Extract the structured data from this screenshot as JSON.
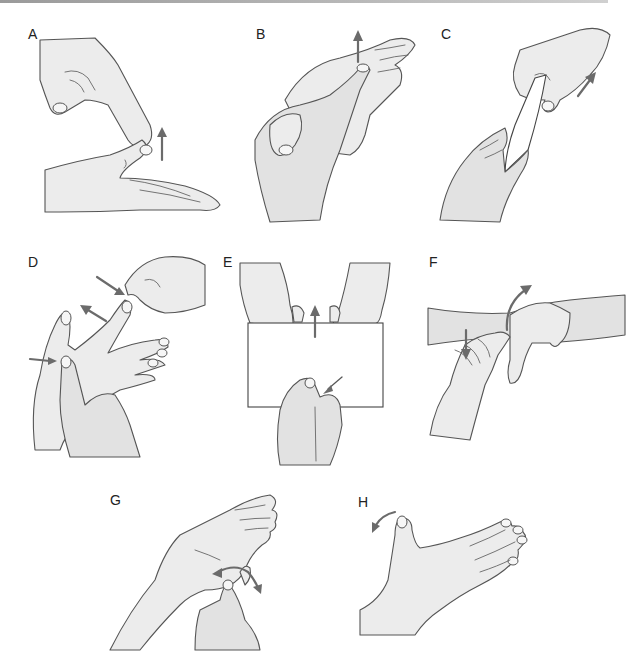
{
  "figure": {
    "top_rule_color": "#a8a8a8",
    "arrow_color": "#6b6b6b",
    "panels": [
      {
        "label": "A",
        "depicts": "index finger and thumb pinching thumb tip of open palm-up hand; arrow pointing up"
      },
      {
        "label": "B",
        "depicts": "hand holding another hand's thumb, pulling fingertip; arrow pointing up"
      },
      {
        "label": "C",
        "depicts": "card held between fingers of one hand, other hand pulling card; arrow pointing up-right"
      },
      {
        "label": "D",
        "depicts": "spread hand; one finger pinched by other hand with inward arrow and outward arrow; thumb base pressed with arrow"
      },
      {
        "label": "E",
        "depicts": "two hands holding top of a sheet of paper, arrow up; lower hand pinching bottom edge, small arrow"
      },
      {
        "label": "F",
        "depicts": "hand placed on wrist of other forearm; down arrow on fingers, curved arrow at wrist"
      },
      {
        "label": "G",
        "depicts": "palm up hand with thumb moved by other hand; two-headed curved arrow"
      },
      {
        "label": "H",
        "depicts": "open hand with thumb abducted; curved arrow at thumb tip"
      }
    ]
  }
}
